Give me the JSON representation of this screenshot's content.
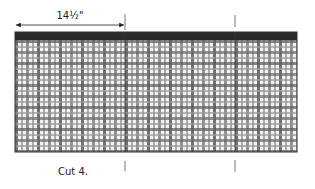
{
  "diagram": {
    "dimension_label": "14½\"",
    "caption": "Cut 4.",
    "fabric": {
      "pattern": "gingham-plaid",
      "band_color": "#2b2b2b",
      "base_color": "#f2f2f2",
      "stripe_light": "#bdbdbd",
      "stripe_dark": "#5a5a5a",
      "outline_color": "#333333"
    },
    "cut_lines": [
      {
        "name": "cut-line-1"
      },
      {
        "name": "cut-line-2"
      }
    ],
    "arrow_color": "#222222",
    "line_color": "#555555"
  }
}
